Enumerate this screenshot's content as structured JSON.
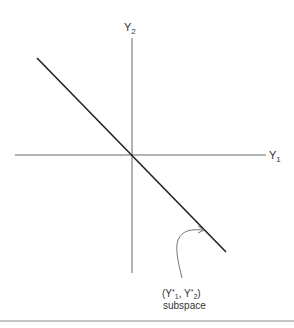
{
  "diagram": {
    "type": "coordinate-plane",
    "axes": {
      "y1_label": "Y",
      "y1_subscript": "1",
      "y2_label": "Y",
      "y2_subscript": "2"
    },
    "line": {
      "description": "line through origin with negative slope",
      "from": [
        37,
        58
      ],
      "to": [
        226,
        252
      ]
    },
    "annotation": {
      "line1_open": "(Y",
      "line1_star1": "*",
      "line1_sub1": "1",
      "line1_mid": ", Y",
      "line1_star2": "*",
      "line1_sub2": "2",
      "line1_close": ")",
      "line2": "subspace"
    },
    "colors": {
      "axis": "#666666",
      "line": "#222222",
      "text": "#333333",
      "rule": "#888888"
    }
  }
}
